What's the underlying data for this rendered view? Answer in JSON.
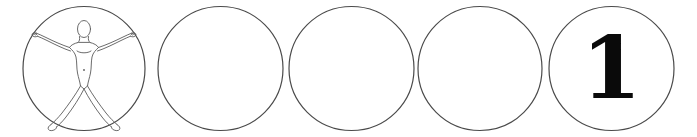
{
  "page": {
    "background_color": "#ffffff",
    "width": 697,
    "height": 137
  },
  "style": {
    "circle_stroke_color": "#4a4a4a",
    "circle_stroke_width": 1.2,
    "circle_fill": "none",
    "figure_stroke_color": "#5a5a5a",
    "figure_stroke_width": 0.9,
    "numeral_color": "#0a0a0a"
  },
  "strip": {
    "count": 5,
    "items": [
      {
        "index": 1,
        "type": "figure-circle",
        "content_name": "vitruvian-figure",
        "label": "",
        "left": 22,
        "width": 124,
        "cx": 62,
        "cy": 68.5,
        "rx": 61,
        "ry": 62
      },
      {
        "index": 2,
        "type": "empty-circle",
        "content_name": "empty",
        "label": "",
        "left": 157,
        "width": 127,
        "cx": 63.5,
        "cy": 68.5,
        "rx": 62.5,
        "ry": 62
      },
      {
        "index": 3,
        "type": "empty-circle",
        "content_name": "empty",
        "label": "",
        "left": 288,
        "width": 127,
        "cx": 63.5,
        "cy": 68.5,
        "rx": 62.5,
        "ry": 62
      },
      {
        "index": 4,
        "type": "empty-circle",
        "content_name": "empty",
        "label": "",
        "left": 417,
        "width": 126,
        "cx": 63,
        "cy": 68.5,
        "rx": 62,
        "ry": 62
      },
      {
        "index": 5,
        "type": "numeral-circle",
        "content_name": "numeral-one",
        "label": "1",
        "left": 548,
        "width": 127,
        "cx": 63.5,
        "cy": 68.5,
        "rx": 62.5,
        "ry": 62
      }
    ]
  }
}
